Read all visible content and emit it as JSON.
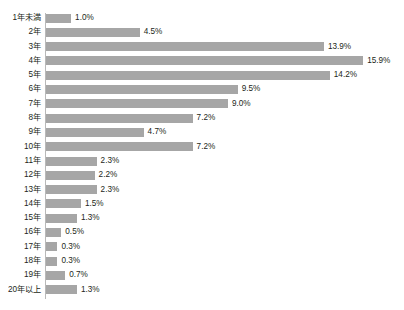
{
  "chart_data": {
    "type": "bar",
    "orientation": "horizontal",
    "title": "",
    "title_clipped": true,
    "xlabel": "",
    "ylabel": "",
    "xlim": [
      0,
      18
    ],
    "grid": false,
    "legend": false,
    "bar_color": "#a6a6a6",
    "background_color": "#ffffff",
    "axis_color": "#b9b9b9",
    "value_suffix": "%",
    "categories": [
      "1年未満",
      "2年",
      "3年",
      "4年",
      "5年",
      "6年",
      "7年",
      "8年",
      "9年",
      "10年",
      "11年",
      "12年",
      "13年",
      "14年",
      "15年",
      "16年",
      "17年",
      "18年",
      "19年",
      "20年以上"
    ],
    "values": [
      1.0,
      4.5,
      13.9,
      15.9,
      14.2,
      9.5,
      9.0,
      7.2,
      4.7,
      7.2,
      2.3,
      2.2,
      2.3,
      1.5,
      1.3,
      0.5,
      0.3,
      0.3,
      0.7,
      1.3
    ],
    "value_labels": [
      "1.0%",
      "4.5%",
      "13.9%",
      "15.9%",
      "14.2%",
      "9.5%",
      "9.0%",
      "7.2%",
      "4.7%",
      "7.2%",
      "2.3%",
      "2.2%",
      "2.3%",
      "1.5%",
      "1.3%",
      "0.5%",
      "0.3%",
      "0.3%",
      "0.7%",
      "1.3%"
    ]
  }
}
